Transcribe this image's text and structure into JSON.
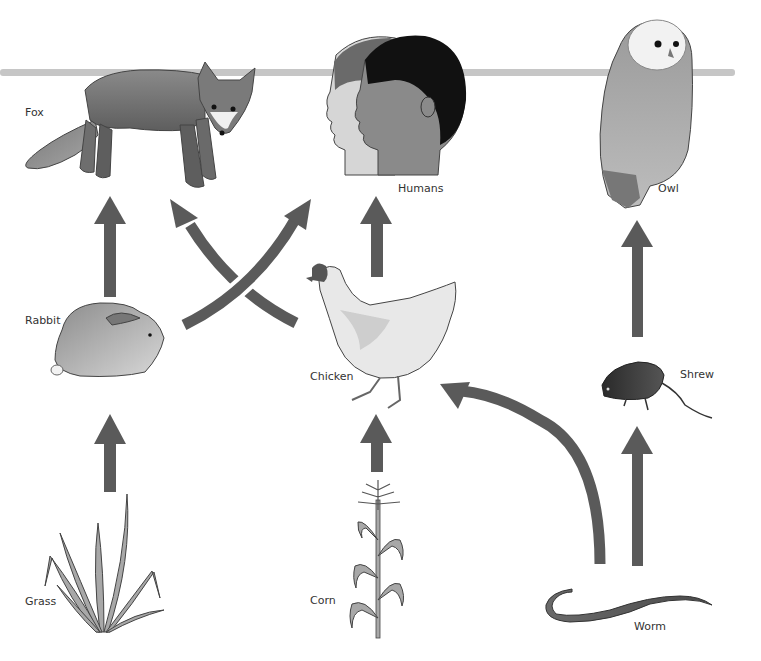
{
  "diagram": {
    "type": "food-web",
    "arrow_color": "#5a5a5a",
    "divider_color": "#c4c4c4",
    "organisms": [
      {
        "id": "fox",
        "label": "Fox"
      },
      {
        "id": "humans",
        "label": "Humans"
      },
      {
        "id": "owl",
        "label": "Owl"
      },
      {
        "id": "rabbit",
        "label": "Rabbit"
      },
      {
        "id": "chicken",
        "label": "Chicken"
      },
      {
        "id": "shrew",
        "label": "Shrew"
      },
      {
        "id": "grass",
        "label": "Grass"
      },
      {
        "id": "corn",
        "label": "Corn"
      },
      {
        "id": "worm",
        "label": "Worm"
      }
    ],
    "edges": [
      {
        "from": "Grass",
        "to": "Rabbit"
      },
      {
        "from": "Rabbit",
        "to": "Fox"
      },
      {
        "from": "Rabbit",
        "to": "Humans"
      },
      {
        "from": "Chicken",
        "to": "Fox"
      },
      {
        "from": "Chicken",
        "to": "Humans"
      },
      {
        "from": "Corn",
        "to": "Chicken"
      },
      {
        "from": "Worm",
        "to": "Chicken"
      },
      {
        "from": "Worm",
        "to": "Shrew"
      },
      {
        "from": "Shrew",
        "to": "Owl"
      }
    ]
  }
}
